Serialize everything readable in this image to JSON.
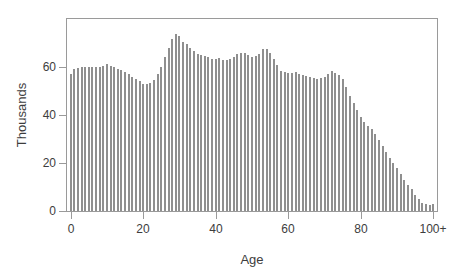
{
  "chart_data": {
    "type": "bar",
    "title": "",
    "xlabel": "Age",
    "ylabel": "Thousands",
    "xlim": [
      -1,
      101
    ],
    "ylim": [
      0,
      80
    ],
    "grid": false,
    "legend": null,
    "bar_color": "#8f8f8f",
    "axis_color": "#9a9a9a",
    "text_color": "#3d3d3d",
    "xticks": [
      {
        "value": 0,
        "label": "0"
      },
      {
        "value": 20,
        "label": "20"
      },
      {
        "value": 40,
        "label": "40"
      },
      {
        "value": 60,
        "label": "60"
      },
      {
        "value": 80,
        "label": "80"
      },
      {
        "value": 100,
        "label": "100+"
      }
    ],
    "yticks": [
      {
        "value": 0,
        "label": "0"
      },
      {
        "value": 20,
        "label": "20"
      },
      {
        "value": 40,
        "label": "40"
      },
      {
        "value": 60,
        "label": "60"
      }
    ],
    "categories": [
      0,
      1,
      2,
      3,
      4,
      5,
      6,
      7,
      8,
      9,
      10,
      11,
      12,
      13,
      14,
      15,
      16,
      17,
      18,
      19,
      20,
      21,
      22,
      23,
      24,
      25,
      26,
      27,
      28,
      29,
      30,
      31,
      32,
      33,
      34,
      35,
      36,
      37,
      38,
      39,
      40,
      41,
      42,
      43,
      44,
      45,
      46,
      47,
      48,
      49,
      50,
      51,
      52,
      53,
      54,
      55,
      56,
      57,
      58,
      59,
      60,
      61,
      62,
      63,
      64,
      65,
      66,
      67,
      68,
      69,
      70,
      71,
      72,
      73,
      74,
      75,
      76,
      77,
      78,
      79,
      80,
      81,
      82,
      83,
      84,
      85,
      86,
      87,
      88,
      89,
      90,
      91,
      92,
      93,
      94,
      95,
      96,
      97,
      98,
      99,
      100
    ],
    "values": [
      57.0,
      59.0,
      59.5,
      60.0,
      60.0,
      60.0,
      60.0,
      60.0,
      59.8,
      60.5,
      61.2,
      60.5,
      59.8,
      59.0,
      58.6,
      58.0,
      57.0,
      56.0,
      55.0,
      54.0,
      53.0,
      53.0,
      53.2,
      54.5,
      57.0,
      60.0,
      64.0,
      68.0,
      71.5,
      73.8,
      72.8,
      70.5,
      69.5,
      68.0,
      66.5,
      65.5,
      65.2,
      64.5,
      64.0,
      63.5,
      63.2,
      63.8,
      62.8,
      63.0,
      63.5,
      64.0,
      65.5,
      66.0,
      65.8,
      65.0,
      64.0,
      64.5,
      65.5,
      67.5,
      67.5,
      66.0,
      63.5,
      61.0,
      58.5,
      58.0,
      57.5,
      57.5,
      57.8,
      57.0,
      56.5,
      56.2,
      56.0,
      55.5,
      55.0,
      55.5,
      56.0,
      57.0,
      58.2,
      57.5,
      56.5,
      55.0,
      51.5,
      48.0,
      45.0,
      42.0,
      39.0,
      37.0,
      35.5,
      34.0,
      32.0,
      29.5,
      27.0,
      24.5,
      22.0,
      20.0,
      18.0,
      15.5,
      13.0,
      11.0,
      9.0,
      6.5,
      5.0,
      3.5,
      3.0,
      2.5,
      3.0
    ]
  }
}
